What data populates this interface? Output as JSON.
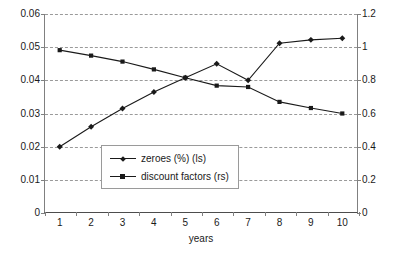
{
  "chart_data": {
    "type": "line",
    "title": "",
    "subtitle": "",
    "xlabel": "years",
    "ylabel": "",
    "ylabel_right": "",
    "grid": true,
    "legend_position": "inside-center-left",
    "x": [
      1,
      2,
      3,
      4,
      5,
      6,
      7,
      8,
      9,
      10
    ],
    "categories": [
      "1",
      "2",
      "3",
      "4",
      "5",
      "6",
      "7",
      "8",
      "9",
      "10"
    ],
    "xlim": [
      0.5,
      10.5
    ],
    "ylim": [
      0,
      0.06
    ],
    "ylim_right": [
      0,
      1.2
    ],
    "yticks": [
      "0",
      "0.01",
      "0.02",
      "0.03",
      "0.04",
      "0.05",
      "0.06"
    ],
    "ytick_values": [
      0,
      0.01,
      0.02,
      0.03,
      0.04,
      0.05,
      0.06
    ],
    "yticks_right": [
      "0",
      "0.2",
      "0.4",
      "0.6",
      "0.8",
      "1",
      "1.2"
    ],
    "ytick_values_right": [
      0,
      0.2,
      0.4,
      0.6,
      0.8,
      1.0,
      1.2
    ],
    "series": [
      {
        "name": "zeroes (%) (ls)",
        "axis": "left",
        "marker": "diamond",
        "color": "#1a1a1a",
        "values": [
          0.02,
          0.026,
          0.0315,
          0.0365,
          0.0408,
          0.045,
          0.04,
          0.0512,
          0.0522,
          0.0527
        ]
      },
      {
        "name": "discount factors (rs)",
        "axis": "right",
        "marker": "square",
        "color": "#1a1a1a",
        "values": [
          0.982,
          0.949,
          0.913,
          0.866,
          0.816,
          0.768,
          0.76,
          0.67,
          0.633,
          0.6
        ]
      }
    ],
    "legend": [
      "zeroes (%) (ls)",
      "discount factors (rs)"
    ]
  },
  "colors": {
    "series": "#1a1a1a",
    "grid": "#9a9a9a",
    "axis": "#808080",
    "text": "#1a1a1a",
    "background": "#ffffff"
  }
}
